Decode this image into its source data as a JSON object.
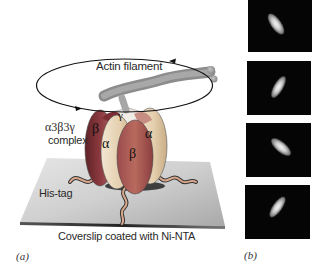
{
  "figure": {
    "panel_a": {
      "letter": "(a)",
      "filament_label": "Actin filament",
      "complex_label_line1": "α3β3γ",
      "complex_label_line2": "complex",
      "subunits": {
        "gamma": "γ",
        "beta_left": "β",
        "alpha_left": "α",
        "beta_front": "β",
        "alpha_right": "α"
      },
      "histag_label": "His-tag",
      "coverslip_label": "Coverslip coated with Ni-NTA"
    },
    "panel_b": {
      "letter": "(b)",
      "frames_count": 4
    }
  },
  "colors": {
    "beta_dark": "#7a2e33",
    "alpha_light": "#e9d8bf",
    "coverslip": "#c8c8c8",
    "filament": "#9a9a9a",
    "frame_bg": "#050505"
  }
}
